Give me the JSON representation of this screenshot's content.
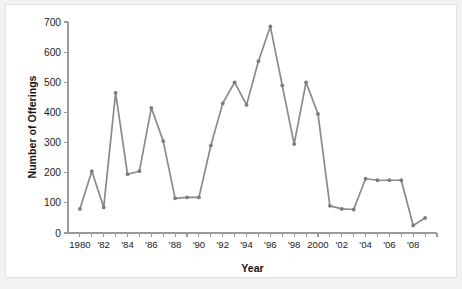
{
  "figure": {
    "background_color": "#f2f2f1",
    "panel_color": "#ffffff",
    "border_color": "#e3e3e2",
    "line_color": "#8a8a8a",
    "marker_color": "#7c7c7c",
    "axis_color": "#9a9a9a",
    "text_color": "#1b1b1b"
  },
  "chart_data": {
    "type": "line",
    "title": "",
    "xlabel": "Year",
    "ylabel": "Number of Offerings",
    "xlim": [
      1979,
      2010
    ],
    "ylim": [
      0,
      700
    ],
    "grid": false,
    "legend": null,
    "x_tick_labels": [
      "1980",
      "'82",
      "'84",
      "'86",
      "'88",
      "'90",
      "'92",
      "'94",
      "'96",
      "'98",
      "2000",
      "'02",
      "'04",
      "'06",
      "'08"
    ],
    "x_tick_values": [
      1980,
      1982,
      1984,
      1986,
      1988,
      1990,
      1992,
      1994,
      1996,
      1998,
      2000,
      2002,
      2004,
      2006,
      2008
    ],
    "x_minor_tick_values": [
      1981,
      1983,
      1985,
      1987,
      1989,
      1991,
      1993,
      1995,
      1997,
      1999,
      2001,
      2003,
      2005,
      2007,
      2009,
      2010
    ],
    "y_tick_labels": [
      "0",
      "100",
      "200",
      "300",
      "400",
      "500",
      "600",
      "700"
    ],
    "y_tick_values": [
      0,
      100,
      200,
      300,
      400,
      500,
      600,
      700
    ],
    "x": [
      1980,
      1981,
      1982,
      1983,
      1984,
      1985,
      1986,
      1987,
      1988,
      1989,
      1990,
      1991,
      1992,
      1993,
      1994,
      1995,
      1996,
      1997,
      1998,
      1999,
      2000,
      2001,
      2002,
      2003,
      2004,
      2005,
      2006,
      2007,
      2008,
      2009
    ],
    "values": [
      80,
      205,
      85,
      465,
      195,
      205,
      415,
      305,
      115,
      118,
      118,
      290,
      430,
      500,
      425,
      570,
      685,
      490,
      295,
      500,
      395,
      90,
      80,
      78,
      180,
      175,
      175,
      175,
      25,
      50
    ],
    "series": [
      {
        "name": "Number of Offerings",
        "values": [
          80,
          205,
          85,
          465,
          195,
          205,
          415,
          305,
          115,
          118,
          118,
          290,
          430,
          500,
          425,
          570,
          685,
          490,
          295,
          500,
          395,
          90,
          80,
          78,
          180,
          175,
          175,
          175,
          25,
          50
        ]
      }
    ]
  }
}
